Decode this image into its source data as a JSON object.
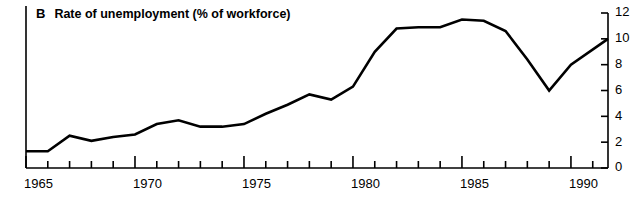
{
  "panel": {
    "letter": "B",
    "title": "Rate of unemployment (% of workforce)"
  },
  "chart_data": {
    "type": "line",
    "title": "Rate of unemployment (% of workforce)",
    "panel_label": "B",
    "xlabel": "",
    "ylabel": "",
    "ylim": [
      0,
      12
    ],
    "xlim": [
      1965,
      1991.7
    ],
    "y_ticks": [
      0,
      2,
      4,
      6,
      8,
      10,
      12
    ],
    "y_axis_position": "right",
    "x_ticks": [
      1965,
      1966,
      1967,
      1968,
      1969,
      1970,
      1971,
      1972,
      1973,
      1974,
      1975,
      1976,
      1977,
      1978,
      1979,
      1980,
      1981,
      1982,
      1983,
      1984,
      1985,
      1986,
      1987,
      1988,
      1989,
      1990,
      1991
    ],
    "x_tick_labels": [
      "1965",
      "1970",
      "1975",
      "1980",
      "1985",
      "1990"
    ],
    "x_labelled_ticks": [
      1965,
      1970,
      1975,
      1980,
      1985,
      1990
    ],
    "grid": false,
    "legend": "none",
    "line_color": "#000000",
    "line_width": 2.6,
    "x": [
      1965,
      1966,
      1967,
      1968,
      1969,
      1970,
      1971,
      1972,
      1973,
      1974,
      1975,
      1976,
      1977,
      1978,
      1979,
      1980,
      1981,
      1982,
      1983,
      1984,
      1985,
      1986,
      1987,
      1988,
      1989,
      1990,
      1991.7
    ],
    "values": [
      1.3,
      1.3,
      2.5,
      2.1,
      2.4,
      2.6,
      3.4,
      3.7,
      3.2,
      3.2,
      3.4,
      4.2,
      4.9,
      5.7,
      5.3,
      6.3,
      9.0,
      10.8,
      10.9,
      10.9,
      11.5,
      11.4,
      10.6,
      8.4,
      6.0,
      8.0,
      10.0
    ],
    "points": [
      {
        "year": 1965,
        "value": 1.3
      },
      {
        "year": 1966,
        "value": 1.3
      },
      {
        "year": 1967,
        "value": 2.5
      },
      {
        "year": 1968,
        "value": 2.1
      },
      {
        "year": 1969,
        "value": 2.4
      },
      {
        "year": 1970,
        "value": 2.6
      },
      {
        "year": 1971,
        "value": 3.4
      },
      {
        "year": 1972,
        "value": 3.7
      },
      {
        "year": 1973,
        "value": 3.2
      },
      {
        "year": 1974,
        "value": 3.2
      },
      {
        "year": 1975,
        "value": 3.4
      },
      {
        "year": 1976,
        "value": 4.2
      },
      {
        "year": 1977,
        "value": 4.9
      },
      {
        "year": 1978,
        "value": 5.7
      },
      {
        "year": 1979,
        "value": 5.3
      },
      {
        "year": 1980,
        "value": 6.3
      },
      {
        "year": 1981,
        "value": 9.0
      },
      {
        "year": 1982,
        "value": 10.8
      },
      {
        "year": 1983,
        "value": 10.9
      },
      {
        "year": 1984,
        "value": 10.9
      },
      {
        "year": 1985,
        "value": 11.5
      },
      {
        "year": 1986,
        "value": 11.4
      },
      {
        "year": 1987,
        "value": 10.6
      },
      {
        "year": 1988,
        "value": 8.4
      },
      {
        "year": 1989,
        "value": 6.0
      },
      {
        "year": 1990,
        "value": 8.0
      },
      {
        "year": 1991.7,
        "value": 10.0
      }
    ]
  }
}
